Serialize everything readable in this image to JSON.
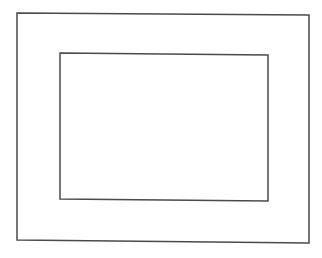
{
  "diagram": {
    "background": "#ffffff",
    "stroke_color": "#4a4a4a",
    "stroke_width": 1.5,
    "shapes": [
      {
        "name": "outer-rectangle",
        "type": "polygon",
        "points": "17,13 309,15 309,243 17,240"
      },
      {
        "name": "inner-rectangle",
        "type": "polygon",
        "points": "60,53 268,55 268,201 60,199"
      }
    ]
  }
}
